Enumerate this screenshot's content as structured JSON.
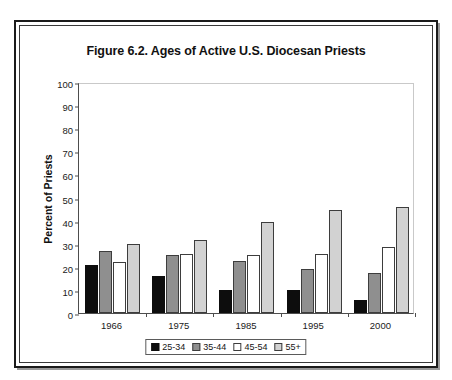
{
  "figure": {
    "title": "Figure 6.2.  Ages of Active U.S. Diocesan Priests"
  },
  "chart_data": {
    "type": "bar",
    "title": "Figure 6.2.  Ages of Active U.S. Diocesan Priests",
    "xlabel": "",
    "ylabel": "Percent of Priests",
    "ylim": [
      0,
      100
    ],
    "ytick_step": 10,
    "yticks": [
      0,
      10,
      20,
      30,
      40,
      50,
      60,
      70,
      80,
      90,
      100
    ],
    "grid": false,
    "legend_position": "bottom-center",
    "categories": [
      "1966",
      "1975",
      "1985",
      "1995",
      "2000"
    ],
    "series": [
      {
        "name": "25-34",
        "color": "#0d0d0d",
        "values": [
          21,
          16,
          10,
          10,
          5.5
        ]
      },
      {
        "name": "35-44",
        "color": "#8f8f8f",
        "values": [
          27,
          25,
          22.5,
          19,
          17.5
        ]
      },
      {
        "name": "45-54",
        "color": "#ffffff",
        "values": [
          22,
          25.5,
          25,
          25.5,
          28.5
        ]
      },
      {
        "name": "55+",
        "color": "#d2d2d2",
        "values": [
          30,
          31.5,
          39.5,
          44.5,
          46
        ]
      }
    ]
  }
}
